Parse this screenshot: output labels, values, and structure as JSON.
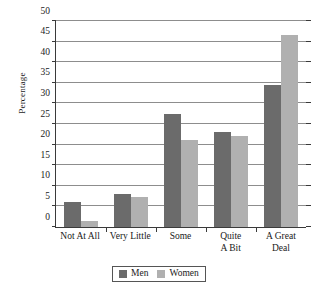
{
  "chart_data": {
    "type": "bar",
    "title": "",
    "subtitle": "",
    "xlabel": "",
    "ylabel": "Percentage",
    "ylim": [
      0,
      50
    ],
    "ytick_step": 5,
    "yticks": [
      0,
      5,
      10,
      15,
      20,
      25,
      30,
      35,
      40,
      45,
      50
    ],
    "ytick_labels": [
      "0",
      "5",
      "10",
      "15",
      "20",
      "25",
      "30",
      "35",
      "40",
      "45",
      "50"
    ],
    "grid": true,
    "grid_axis": "y",
    "legend_position": "bottom-center",
    "categories": [
      "Not At All",
      "Very Little",
      "Some",
      "Quite A Bit",
      "A Great Deal"
    ],
    "category_lines": [
      [
        "Not At All"
      ],
      [
        "Very Little"
      ],
      [
        "Some"
      ],
      [
        "Quite",
        "A Bit"
      ],
      [
        "A Great",
        "Deal"
      ]
    ],
    "series": [
      {
        "name": "Men",
        "color": "#6b6b6b",
        "values": [
          6.0,
          8.0,
          27.5,
          23.0,
          34.5
        ]
      },
      {
        "name": "Women",
        "color": "#b0b0b0",
        "values": [
          1.5,
          7.3,
          21.0,
          22.0,
          46.5
        ]
      }
    ]
  },
  "legend": {
    "entries": [
      {
        "label": "Men",
        "swatch": "men-swatch"
      },
      {
        "label": "Women",
        "swatch": "women-swatch"
      }
    ]
  },
  "colors": {
    "men": "#6b6b6b",
    "women": "#b0b0b0",
    "axis": "#3a3a3a",
    "gridline": "#8d8d8d",
    "background": "#ffffff",
    "text": "#1a1a1a"
  }
}
